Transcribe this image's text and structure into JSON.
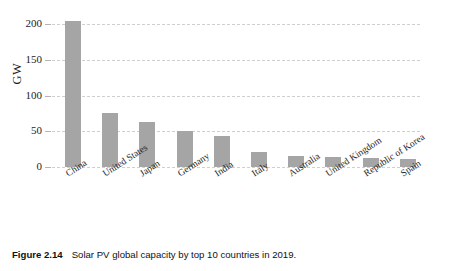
{
  "chart_data": {
    "type": "bar",
    "title": "",
    "xlabel": "",
    "ylabel": "GW",
    "ylim": [
      0,
      210
    ],
    "yticks": [
      0,
      50,
      100,
      150,
      200
    ],
    "ytick_labels": [
      "0",
      "50",
      "100",
      "150",
      "200"
    ],
    "grid": true,
    "legend": false,
    "bar_color": "#a5a5a5",
    "grid_color": "#cfcfcf",
    "categories": [
      "China",
      "United States",
      "Japan",
      "Germany",
      "India",
      "Italy",
      "Australia",
      "United Kingdom",
      "Republic of Korea",
      "Spain"
    ],
    "values": [
      204,
      76,
      63,
      50,
      43,
      21,
      15,
      14,
      12,
      11
    ],
    "series": [
      {
        "name": "Solar PV global capacity 2019 (GW)",
        "values": [
          204,
          76,
          63,
          50,
          43,
          21,
          15,
          14,
          12,
          11
        ]
      }
    ]
  },
  "caption": {
    "label": "Figure 2.14",
    "text": "Solar PV global capacity by top 10 countries in 2019."
  }
}
